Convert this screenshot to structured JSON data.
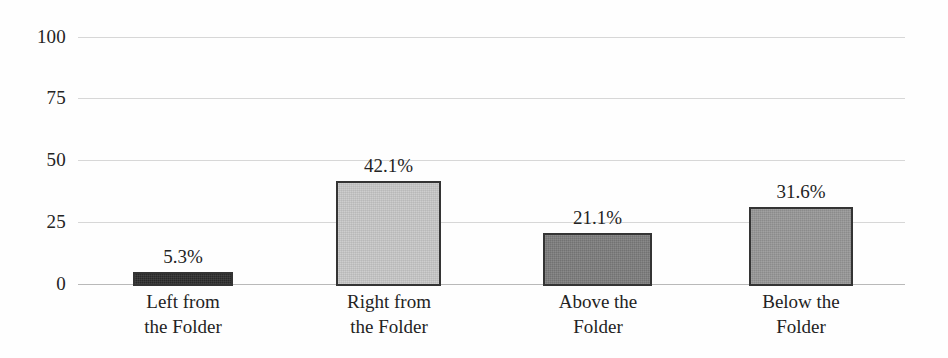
{
  "chart_data": {
    "type": "bar",
    "title": "",
    "subtitle": "",
    "xlabel": "",
    "ylabel": "",
    "ylim": [
      0,
      100
    ],
    "yticks": [
      0,
      25,
      50,
      75,
      100
    ],
    "ytick_labels": [
      "0",
      "25",
      "50",
      "75",
      "100"
    ],
    "grid": true,
    "legend": "none",
    "categories": [
      "Left from the Folder",
      "Right from the Folder",
      "Above the Folder",
      "Below the Folder"
    ],
    "category_lines": [
      [
        "Left from",
        "the Folder"
      ],
      [
        "Right from",
        "the Folder"
      ],
      [
        "Above the",
        "Folder"
      ],
      [
        "Below the",
        "Folder"
      ]
    ],
    "values": [
      5.3,
      42.1,
      21.1,
      31.6
    ],
    "data_labels": [
      "5.3%",
      "42.1%",
      "21.1%",
      "31.6%"
    ],
    "bar_colors": [
      "#2b2b2b",
      "#c8c8c8",
      "#7c7c7c",
      "#979797"
    ],
    "bar_border_color": "#343434",
    "gridline_color": "#d7d7d7",
    "axis_color": "#b9b9b9",
    "background_color": "#fefefe"
  }
}
